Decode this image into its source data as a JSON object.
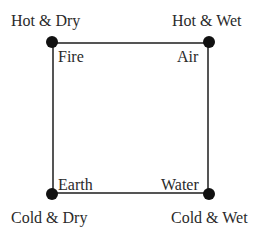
{
  "diagram": {
    "type": "square-of-opposition",
    "corners": {
      "top_left": {
        "quality": "Hot & Dry",
        "element": "Fire"
      },
      "top_right": {
        "quality": "Hot & Wet",
        "element": "Air"
      },
      "bottom_left": {
        "quality": "Cold & Dry",
        "element": "Earth"
      },
      "bottom_right": {
        "quality": "Cold & Wet",
        "element": "Water"
      }
    },
    "colors": {
      "line": "#555555",
      "dot": "#111111",
      "text": "#2a2a2a"
    }
  }
}
